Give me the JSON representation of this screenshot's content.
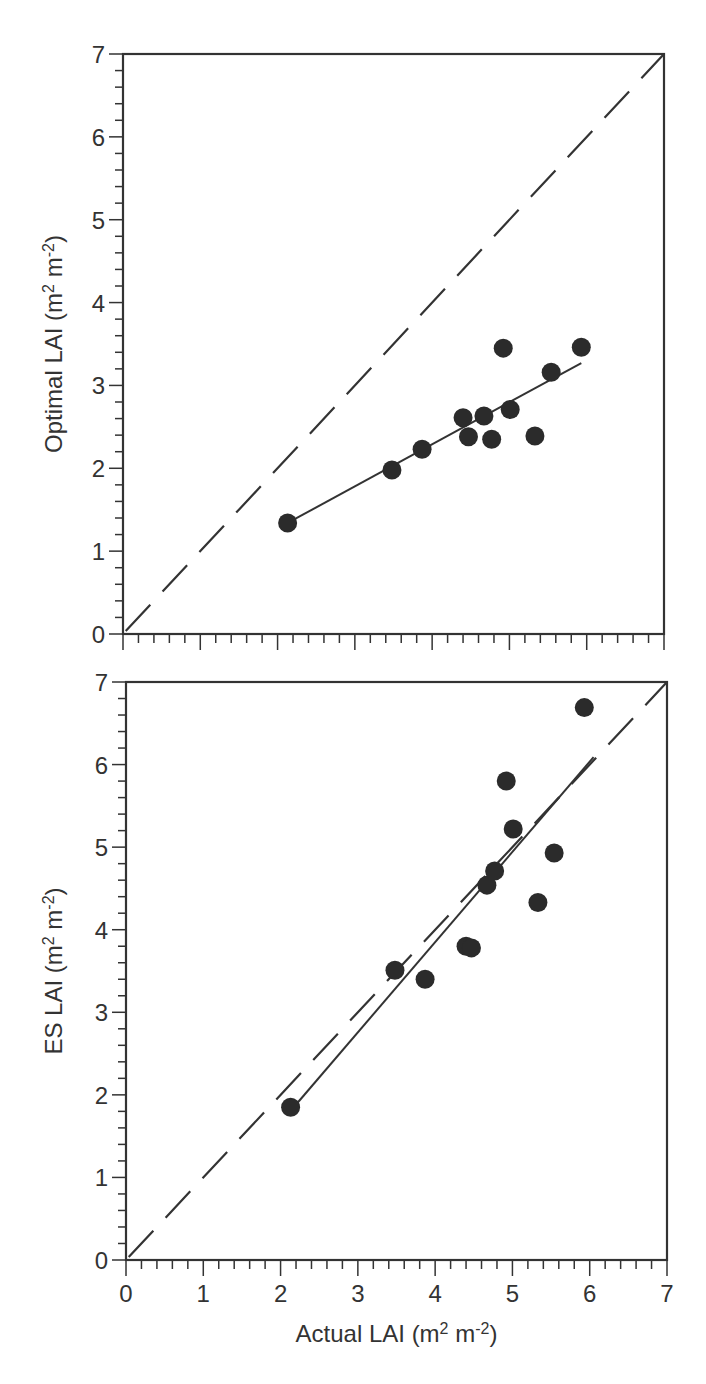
{
  "figure": {
    "panels": [
      "top",
      "bottom"
    ]
  },
  "colors": {
    "ink": "#333333",
    "point": "#2b2b2b",
    "background": "#ffffff"
  },
  "chart_data": [
    {
      "type": "scatter",
      "title": "",
      "xlabel": "Actual LAI (m2 m-2)",
      "ylabel": "Optimal LAI (m2 m-2)",
      "ylabel_parts": {
        "prefix": "Optimal LAI (m",
        "sup1": "2",
        "mid": " m",
        "sup2": "-2",
        "suffix": ")"
      },
      "xlim": [
        0,
        7
      ],
      "ylim": [
        0,
        7
      ],
      "xticks": [
        0,
        1,
        2,
        3,
        4,
        5,
        6,
        7
      ],
      "yticks": [
        0,
        1,
        2,
        3,
        4,
        5,
        6,
        7
      ],
      "show_xtick_labels": false,
      "minor_tick_step": 0.2,
      "grid": false,
      "legend": null,
      "series": [
        {
          "name": "observations",
          "kind": "points",
          "x": [
            2.13,
            3.48,
            3.87,
            4.4,
            4.47,
            4.67,
            4.77,
            4.92,
            5.01,
            5.33,
            5.54,
            5.93
          ],
          "y": [
            1.34,
            1.98,
            2.23,
            2.61,
            2.38,
            2.63,
            2.35,
            3.45,
            2.71,
            2.39,
            3.16,
            3.46
          ]
        },
        {
          "name": "regression",
          "kind": "solid-line",
          "x": [
            2.13,
            5.93
          ],
          "y": [
            1.34,
            3.27
          ]
        },
        {
          "name": "1:1 line",
          "kind": "dashed-line",
          "x": [
            0,
            7
          ],
          "y": [
            0,
            7
          ]
        }
      ]
    },
    {
      "type": "scatter",
      "title": "",
      "xlabel": "Actual LAI (m2 m-2)",
      "ylabel": "ES LAI (m2 m-2)",
      "xlabel_parts": {
        "prefix": "Actual LAI (m",
        "sup1": "2",
        "mid": " m",
        "sup2": "-2",
        "suffix": ")"
      },
      "ylabel_parts": {
        "prefix": "ES LAI (m",
        "sup1": "2",
        "mid": " m",
        "sup2": "-2",
        "suffix": ")"
      },
      "xlim": [
        0,
        7
      ],
      "ylim": [
        0,
        7
      ],
      "xticks": [
        0,
        1,
        2,
        3,
        4,
        5,
        6,
        7
      ],
      "yticks": [
        0,
        1,
        2,
        3,
        4,
        5,
        6,
        7
      ],
      "show_xtick_labels": true,
      "minor_tick_step": 0.2,
      "grid": false,
      "legend": null,
      "series": [
        {
          "name": "observations",
          "kind": "points",
          "x": [
            2.13,
            3.48,
            3.87,
            4.4,
            4.47,
            4.67,
            4.77,
            4.92,
            5.01,
            5.33,
            5.54,
            5.93
          ],
          "y": [
            1.85,
            3.51,
            3.4,
            3.8,
            3.78,
            4.54,
            4.71,
            5.8,
            5.22,
            4.33,
            4.93,
            6.69
          ]
        },
        {
          "name": "regression",
          "kind": "solid-line",
          "x": [
            2.17,
            6.05
          ],
          "y": [
            1.85,
            6.09
          ]
        },
        {
          "name": "1:1 line",
          "kind": "dashed-line",
          "x": [
            0,
            7
          ],
          "y": [
            0,
            7
          ]
        }
      ]
    }
  ]
}
